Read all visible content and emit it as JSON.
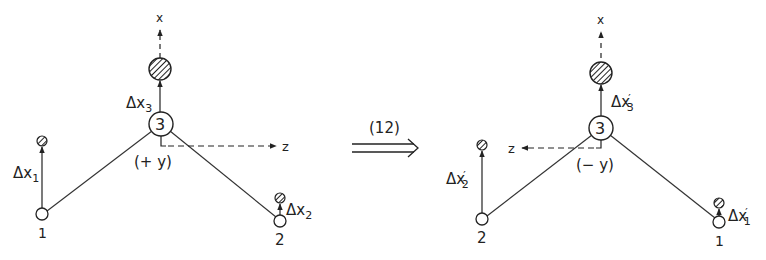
{
  "diagram": {
    "transform_label": "(12)",
    "left": {
      "axis_x": "x",
      "axis_z": "z",
      "axis_y": "(+ y)",
      "atom3_label": "3",
      "atom1_label": "1",
      "atom2_label": "2",
      "disp3": {
        "base": "Δx",
        "sub": "3",
        "prime": ""
      },
      "disp1": {
        "base": "Δx",
        "sub": "1",
        "prime": ""
      },
      "disp2": {
        "base": "Δx",
        "sub": "2",
        "prime": ""
      }
    },
    "right": {
      "axis_x": "x",
      "axis_z": "z",
      "axis_y": "(− y)",
      "atom3_label": "3",
      "atom1_label": "1",
      "atom2_label": "2",
      "disp3": {
        "base": "Δx",
        "sub": "3",
        "prime": "′"
      },
      "disp2": {
        "base": "Δx",
        "sub": "2",
        "prime": "′"
      },
      "disp1": {
        "base": "Δx",
        "sub": "1",
        "prime": "′"
      }
    },
    "colors": {
      "ink": "#222222",
      "background": "#ffffff"
    }
  }
}
